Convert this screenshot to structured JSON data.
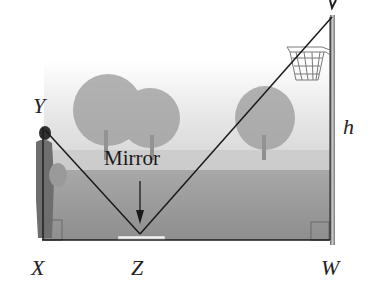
{
  "diagram": {
    "points": {
      "Y": "Y",
      "X": "X",
      "Z": "Z",
      "W": "W",
      "V": "V"
    },
    "height_label": "h",
    "mirror_label": "Mirror",
    "colors": {
      "line": "#1a1a1a",
      "pole": "#8a8a8a",
      "ground": "#8c8c8c",
      "sky": "#e6e6e6",
      "person": "#6f6f6f",
      "mirror": "#f4f4f4"
    }
  }
}
